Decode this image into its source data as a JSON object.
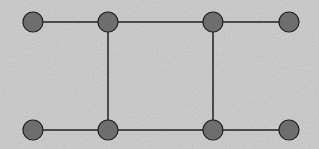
{
  "diagram": {
    "type": "graph",
    "background": "#c8c8c8",
    "node_fill": "#6e6e6e",
    "node_stroke": "#222222",
    "edge_color": "#222222",
    "node_radius": 10,
    "nodes": [
      {
        "id": "n1",
        "x": 33,
        "y": 22
      },
      {
        "id": "n2",
        "x": 108,
        "y": 22
      },
      {
        "id": "n3",
        "x": 213,
        "y": 22
      },
      {
        "id": "n4",
        "x": 289,
        "y": 22
      },
      {
        "id": "n5",
        "x": 33,
        "y": 130
      },
      {
        "id": "n6",
        "x": 108,
        "y": 130
      },
      {
        "id": "n7",
        "x": 213,
        "y": 130
      },
      {
        "id": "n8",
        "x": 289,
        "y": 130
      }
    ],
    "edges": [
      [
        "n1",
        "n2"
      ],
      [
        "n2",
        "n3"
      ],
      [
        "n3",
        "n4"
      ],
      [
        "n5",
        "n6"
      ],
      [
        "n6",
        "n7"
      ],
      [
        "n7",
        "n8"
      ],
      [
        "n2",
        "n6"
      ],
      [
        "n3",
        "n7"
      ]
    ]
  }
}
